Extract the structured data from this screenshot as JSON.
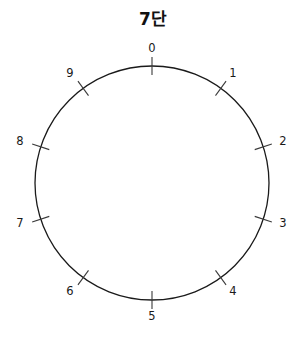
{
  "figure": {
    "title": "7단",
    "background_color": "#ffffff",
    "width": 306,
    "height": 340
  },
  "chart_data": {
    "type": "scatter",
    "title": "7단",
    "subtitle": "",
    "xlabel": "",
    "ylabel": "",
    "grid": false,
    "legend": null,
    "circle": {
      "center_x": 152,
      "center_y": 183,
      "radius": 117,
      "stroke_color": "#1a1a1a",
      "stroke_width": 1.3,
      "fill": "none"
    },
    "modulus": 10,
    "multiplier": 7,
    "start_angle_deg": 90,
    "direction": "clockwise",
    "tick": {
      "inner_radius": 108,
      "outer_radius": 126,
      "stroke_color": "#3a3a3a",
      "stroke_width": 1.1
    },
    "label_radius": 137,
    "categories": [
      "0",
      "1",
      "2",
      "3",
      "4",
      "5",
      "6",
      "7",
      "8",
      "9"
    ],
    "points": [
      {
        "label": "0",
        "index": 0,
        "angle_deg": 90,
        "label_x": 152,
        "label_y": 49
      },
      {
        "label": "1",
        "index": 1,
        "angle_deg": 54,
        "label_x": 233,
        "label_y": 74
      },
      {
        "label": "2",
        "index": 2,
        "angle_deg": 18,
        "label_x": 283,
        "label_y": 142
      },
      {
        "label": "3",
        "index": 3,
        "angle_deg": -18,
        "label_x": 283,
        "label_y": 224
      },
      {
        "label": "4",
        "index": 4,
        "angle_deg": -54,
        "label_x": 233,
        "label_y": 292
      },
      {
        "label": "5",
        "index": 5,
        "angle_deg": -90,
        "label_x": 152,
        "label_y": 317
      },
      {
        "label": "6",
        "index": 6,
        "angle_deg": -126,
        "label_x": 70,
        "label_y": 292
      },
      {
        "label": "7",
        "index": 7,
        "angle_deg": -162,
        "label_x": 20,
        "label_y": 224
      },
      {
        "label": "8",
        "index": 8,
        "angle_deg": 162,
        "label_x": 20,
        "label_y": 142
      },
      {
        "label": "9",
        "index": 9,
        "angle_deg": 126,
        "label_x": 70,
        "label_y": 74
      }
    ],
    "chords": []
  }
}
